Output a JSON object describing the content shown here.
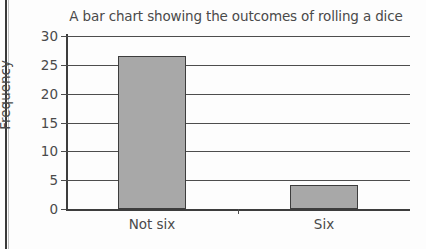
{
  "chart_data": {
    "type": "bar",
    "title": "A bar chart showing the outcomes of rolling a dice",
    "xlabel": "",
    "ylabel": "Frequency",
    "categories": [
      "Not six",
      "Six"
    ],
    "values": [
      26.5,
      4.2
    ],
    "ylim": [
      0,
      30
    ],
    "yticks": [
      0,
      5,
      10,
      15,
      20,
      25,
      30
    ],
    "ytick_labels": [
      "0",
      "5",
      "10",
      "15",
      "20",
      "25",
      "30"
    ],
    "grid": true,
    "legend": false,
    "bar_color": "#a8a8a8",
    "bar_edge_color": "#3d3d3d",
    "axis_color": "#3d3d3d",
    "text_color": "#4a4a4a",
    "background": "#fdfdfd"
  }
}
